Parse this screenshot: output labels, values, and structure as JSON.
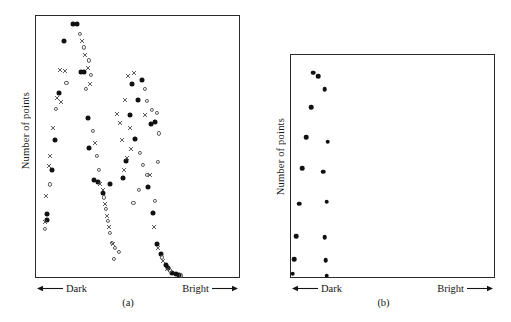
{
  "figure": {
    "background_color": "#ffffff",
    "ink_color": "#111111"
  },
  "panels": [
    {
      "id": "a",
      "caption": "(a)",
      "ylabel": "Number of points",
      "axis_left_label": "Dark",
      "axis_right_label": "Bright",
      "left_arrow_icon": "left-arrow-icon",
      "right_arrow_icon": "right-arrow-icon"
    },
    {
      "id": "b",
      "caption": "(b)",
      "ylabel": "Number of points",
      "axis_left_label": "Dark",
      "axis_right_label": "Bright",
      "left_arrow_icon": "left-arrow-icon",
      "right_arrow_icon": "right-arrow-icon"
    }
  ],
  "chart_data": [
    {
      "type": "scatter",
      "panel": "a",
      "title": "(a)",
      "xlabel": "Dark ← brightness → Bright",
      "ylabel": "Number of points",
      "xlim": [
        0,
        100
      ],
      "ylim": [
        0,
        100
      ],
      "grid": false,
      "legend": "none",
      "axis_ticks": "none",
      "description": "Bimodal distribution of point counts across brightness; three overlaid marker series trace the same twin-peaked curve with a central valley and a long tail falling to zero at the bright end.",
      "series": [
        {
          "name": "filled-circle-series",
          "marker": "filled-circle",
          "color": "#111111",
          "points": [
            [
              18.0,
              97.0
            ],
            [
              20.4,
              97.0
            ],
            [
              13.7,
              90.5
            ],
            [
              22.0,
              78.5
            ],
            [
              23.5,
              78.5
            ],
            [
              11.2,
              70.5
            ],
            [
              25.4,
              61.0
            ],
            [
              9.3,
              52.5
            ],
            [
              26.3,
              49.5
            ],
            [
              7.8,
              41.0
            ],
            [
              28.8,
              37.0
            ],
            [
              30.3,
              36.5
            ],
            [
              33.2,
              32.0
            ],
            [
              36.6,
              35.5
            ],
            [
              5.4,
              24.0
            ],
            [
              5.4,
              22.0
            ],
            [
              47.5,
              74.0
            ],
            [
              52.0,
              75.5
            ],
            [
              50.0,
              68.0
            ],
            [
              46.4,
              62.0
            ],
            [
              56.6,
              58.5
            ],
            [
              58.5,
              59.5
            ],
            [
              49.0,
              53.0
            ],
            [
              44.5,
              44.5
            ],
            [
              43.0,
              38.0
            ],
            [
              55.0,
              34.5
            ],
            [
              57.5,
              24.5
            ],
            [
              59.5,
              12.5
            ],
            [
              61.5,
              9.0
            ],
            [
              63.8,
              4.5
            ],
            [
              65.0,
              3.5
            ],
            [
              67.0,
              1.5
            ],
            [
              69.0,
              1.0
            ],
            [
              70.5,
              0.8
            ]
          ]
        },
        {
          "name": "open-circle-series",
          "marker": "open-circle",
          "color": "#555555",
          "points": [
            [
              21.5,
              93.0
            ],
            [
              23.5,
              88.0
            ],
            [
              26.0,
              83.0
            ],
            [
              27.0,
              77.5
            ],
            [
              15.0,
              74.5
            ],
            [
              24.5,
              72.0
            ],
            [
              10.0,
              64.5
            ],
            [
              28.0,
              56.0
            ],
            [
              30.0,
              46.5
            ],
            [
              31.0,
              41.0
            ],
            [
              6.8,
              35.5
            ],
            [
              33.5,
              30.5
            ],
            [
              34.5,
              26.0
            ],
            [
              35.5,
              21.5
            ],
            [
              4.2,
              18.5
            ],
            [
              36.5,
              17.0
            ],
            [
              37.5,
              13.0
            ],
            [
              39.0,
              11.0
            ],
            [
              41.0,
              9.5
            ],
            [
              38.5,
              7.0
            ],
            [
              53.5,
              72.0
            ],
            [
              54.5,
              67.5
            ],
            [
              57.0,
              64.0
            ],
            [
              59.5,
              63.0
            ],
            [
              60.5,
              55.0
            ],
            [
              51.0,
              47.5
            ],
            [
              52.5,
              43.0
            ],
            [
              60.0,
              44.0
            ],
            [
              54.5,
              39.0
            ],
            [
              50.5,
              33.5
            ],
            [
              48.0,
              28.5
            ],
            [
              58.5,
              29.0
            ],
            [
              62.0,
              7.5
            ],
            [
              66.0,
              2.5
            ],
            [
              71.5,
              0.6
            ]
          ]
        },
        {
          "name": "cross-series",
          "marker": "cross",
          "color": "#4a4a4a",
          "points": [
            [
              22.5,
              90.5
            ],
            [
              24.0,
              85.0
            ],
            [
              12.0,
              79.5
            ],
            [
              14.5,
              79.0
            ],
            [
              25.5,
              80.0
            ],
            [
              26.5,
              74.0
            ],
            [
              10.5,
              68.5
            ],
            [
              12.5,
              67.0
            ],
            [
              8.5,
              57.0
            ],
            [
              29.0,
              51.5
            ],
            [
              7.0,
              46.5
            ],
            [
              6.5,
              42.5
            ],
            [
              31.5,
              35.5
            ],
            [
              33.0,
              33.5
            ],
            [
              5.0,
              31.0
            ],
            [
              34.0,
              28.0
            ],
            [
              35.0,
              23.5
            ],
            [
              4.5,
              21.0
            ],
            [
              36.0,
              19.0
            ],
            [
              38.0,
              12.5
            ],
            [
              45.5,
              77.0
            ],
            [
              48.5,
              78.0
            ],
            [
              44.0,
              68.0
            ],
            [
              53.5,
              62.0
            ],
            [
              41.5,
              59.0
            ],
            [
              46.5,
              57.0
            ],
            [
              42.5,
              52.5
            ],
            [
              47.0,
              49.0
            ],
            [
              45.0,
              45.5
            ],
            [
              43.5,
              41.0
            ],
            [
              56.0,
              39.0
            ],
            [
              40.0,
              62.5
            ],
            [
              58.0,
              19.0
            ],
            [
              60.0,
              11.0
            ],
            [
              62.5,
              6.0
            ],
            [
              64.5,
              3.0
            ]
          ]
        }
      ]
    },
    {
      "type": "scatter",
      "panel": "b",
      "title": "(b)",
      "xlabel": "Dark ← brightness → Bright",
      "ylabel": "Number of points",
      "xlim": [
        0,
        100
      ],
      "ylim": [
        0,
        100
      ],
      "grid": false,
      "legend": "none",
      "axis_ticks": "none",
      "description": "Single unimodal series of filled circles confined to the dark end of the brightness axis, rising to a peak and falling back to the baseline.",
      "series": [
        {
          "name": "filled-circle-series",
          "marker": "filled-circle",
          "color": "#111111",
          "points": [
            [
              11.0,
              92.0
            ],
            [
              13.5,
              90.5
            ],
            [
              16.5,
              84.5
            ],
            [
              10.0,
              76.5
            ],
            [
              7.5,
              63.0
            ],
            [
              18.0,
              61.0
            ],
            [
              5.5,
              49.0
            ],
            [
              16.0,
              47.5
            ],
            [
              4.0,
              33.0
            ],
            [
              17.5,
              34.0
            ],
            [
              2.5,
              18.5
            ],
            [
              16.5,
              18.0
            ],
            [
              1.5,
              8.0
            ],
            [
              17.0,
              7.5
            ],
            [
              0.8,
              1.5
            ],
            [
              17.5,
              0.5
            ]
          ]
        }
      ]
    }
  ]
}
